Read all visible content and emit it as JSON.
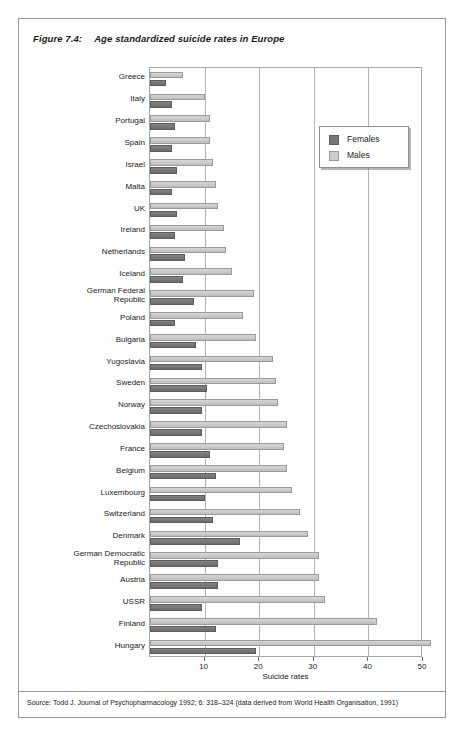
{
  "figure": {
    "number": "Figure 7.4:",
    "title": "Age standardized suicide rates in Europe"
  },
  "legend": {
    "position": "top-right",
    "entries": [
      {
        "label": "Females",
        "color": "#767676"
      },
      {
        "label": "Males",
        "color": "#cdcdcd"
      }
    ]
  },
  "source": {
    "text": "Source: Todd J. Journal of Psychopharmacology 1992; 6: 318–324 (data derived from World Health Organisation, 1991)"
  },
  "chart_data": {
    "type": "bar",
    "orientation": "horizontal",
    "title": "Age standardized suicide rates in Europe",
    "xlabel": "Suicide rates",
    "ylabel": "",
    "xlim": [
      0,
      50
    ],
    "xticks": [
      0,
      10,
      20,
      30,
      40,
      50
    ],
    "grid": true,
    "legend_position": "top-right",
    "categories": [
      "Greece",
      "Italy",
      "Portugal",
      "Spain",
      "Israel",
      "Malta",
      "UK",
      "Ireland",
      "Netherlands",
      "Iceland",
      "German Federal\nRepublic",
      "Poland",
      "Bulgaria",
      "Yugoslavia",
      "Sweden",
      "Norway",
      "Czechoslovakia",
      "France",
      "Belgium",
      "Luxembourg",
      "Switzerland",
      "Denmark",
      "German Democratic\nRepublic",
      "Austria",
      "USSR",
      "Finland",
      "Hungary"
    ],
    "series": [
      {
        "name": "Females",
        "color": "#767676",
        "values": [
          3.0,
          4.0,
          4.5,
          4.0,
          5.0,
          4.0,
          5.0,
          4.5,
          6.5,
          6.0,
          8.0,
          4.5,
          8.5,
          9.5,
          10.5,
          9.5,
          9.5,
          11.0,
          12.0,
          10.0,
          11.5,
          16.5,
          12.5,
          12.5,
          9.5,
          12.0,
          19.5
        ]
      },
      {
        "name": "Males",
        "color": "#cdcdcd",
        "values": [
          6.0,
          10.0,
          11.0,
          11.0,
          11.5,
          12.0,
          12.5,
          13.5,
          14.0,
          15.0,
          19.0,
          17.0,
          19.5,
          22.5,
          23.0,
          23.5,
          25.0,
          24.5,
          25.0,
          26.0,
          27.5,
          29.0,
          31.0,
          31.0,
          32.0,
          41.5,
          51.5
        ]
      }
    ]
  }
}
